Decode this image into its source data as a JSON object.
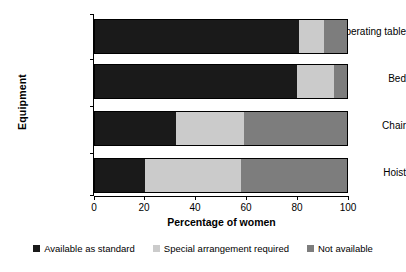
{
  "chart_data": {
    "type": "bar",
    "orientation": "horizontal",
    "stacked": true,
    "title": "",
    "xlabel": "Percentage of women",
    "ylabel": "Equipment",
    "xlim": [
      0,
      100
    ],
    "xticks": [
      0,
      20,
      40,
      60,
      80,
      100
    ],
    "xtick_labels": [
      "0",
      "20",
      "40",
      "60",
      "80",
      "100"
    ],
    "grid": false,
    "legend_position": "bottom",
    "categories": [
      "Operating table",
      "Bed",
      "Chair",
      "Hoist"
    ],
    "series": [
      {
        "name": "Available as standard",
        "color": "#1a1a1a",
        "values": [
          81,
          80,
          32,
          20
        ]
      },
      {
        "name": "Special arrangement required",
        "color": "#cbcbcb",
        "values": [
          10,
          15,
          27,
          38
        ]
      },
      {
        "name": "Not available",
        "color": "#7d7d7d",
        "values": [
          9,
          5,
          41,
          42
        ]
      }
    ]
  }
}
